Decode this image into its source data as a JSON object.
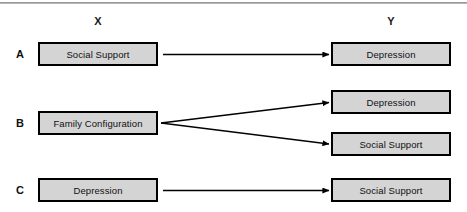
{
  "figure": {
    "headers": {
      "x_label": "X",
      "y_label": "Y"
    },
    "rows": [
      {
        "label": "A",
        "predictor": "Social Support",
        "outcomes": [
          "Depression"
        ]
      },
      {
        "label": "B",
        "predictor": "Family Configuration",
        "outcomes": [
          "Depression",
          "Social Support"
        ]
      },
      {
        "label": "C",
        "predictor": "Depression",
        "outcomes": [
          "Social Support"
        ]
      }
    ],
    "caption": "",
    "colors": {
      "box_fill": "#d4d4d4",
      "box_border": "#000000",
      "arrow": "#000000",
      "rule": "#8d8d8d",
      "text": "#101010",
      "background": "#ffffff"
    }
  }
}
